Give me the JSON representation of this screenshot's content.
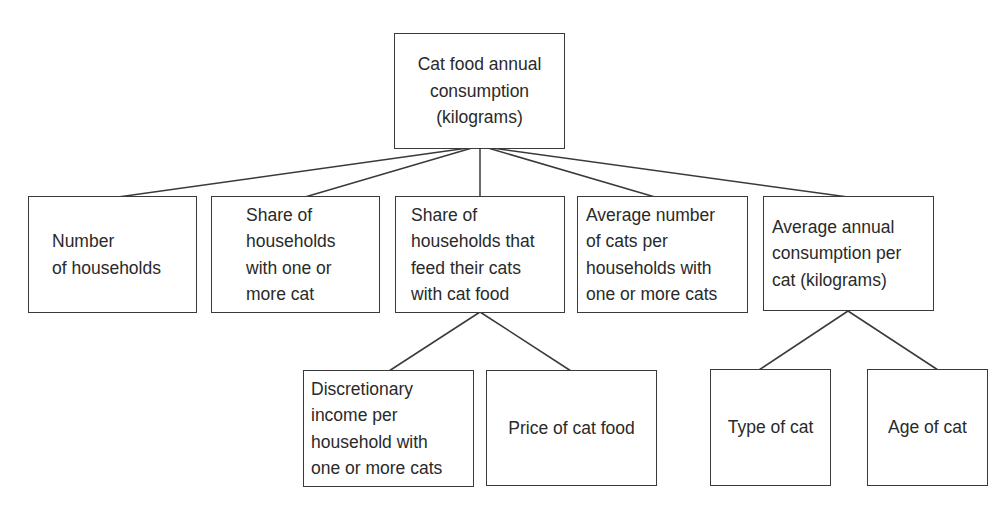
{
  "diagram": {
    "type": "tree",
    "root": {
      "id": "cat-food-annual-consumption",
      "label": "Cat food annual\nconsumption\n(kilograms)"
    },
    "level1": [
      {
        "id": "number-of-households",
        "label": "Number\nof households"
      },
      {
        "id": "share-households-with-cat",
        "label": "Share of\nhouseholds\nwith one or\nmore cat"
      },
      {
        "id": "share-households-feed-cat-food",
        "label": "Share of\nhouseholds that\nfeed their cats\nwith cat food"
      },
      {
        "id": "avg-cats-per-household",
        "label": "Average number\nof cats per\nhouseholds with\none or more cats"
      },
      {
        "id": "avg-consumption-per-cat",
        "label": "Average annual\nconsumption per\ncat (kilograms)"
      }
    ],
    "level2": [
      {
        "id": "discretionary-income",
        "parent": "share-households-feed-cat-food",
        "label": "Discretionary\nincome per\nhousehold with\none or more cats"
      },
      {
        "id": "price-of-cat-food",
        "parent": "share-households-feed-cat-food",
        "label": "Price of cat food"
      },
      {
        "id": "type-of-cat",
        "parent": "avg-consumption-per-cat",
        "label": "Type of cat"
      },
      {
        "id": "age-of-cat",
        "parent": "avg-consumption-per-cat",
        "label": "Age of cat"
      }
    ],
    "edges": [
      [
        "cat-food-annual-consumption",
        "number-of-households"
      ],
      [
        "cat-food-annual-consumption",
        "share-households-with-cat"
      ],
      [
        "cat-food-annual-consumption",
        "share-households-feed-cat-food"
      ],
      [
        "cat-food-annual-consumption",
        "avg-cats-per-household"
      ],
      [
        "cat-food-annual-consumption",
        "avg-consumption-per-cat"
      ],
      [
        "share-households-feed-cat-food",
        "discretionary-income"
      ],
      [
        "share-households-feed-cat-food",
        "price-of-cat-food"
      ],
      [
        "avg-consumption-per-cat",
        "type-of-cat"
      ],
      [
        "avg-consumption-per-cat",
        "age-of-cat"
      ]
    ],
    "colors": {
      "line": "#3a3a3a",
      "text": "#2a2a2a",
      "background": "#ffffff"
    }
  }
}
